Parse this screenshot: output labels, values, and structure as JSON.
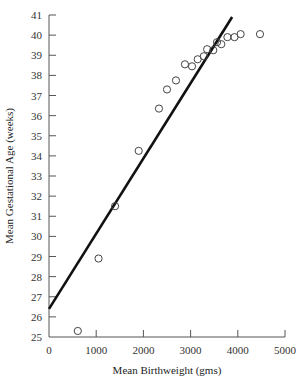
{
  "chart_data": {
    "type": "scatter",
    "title": "",
    "xlabel": "Mean Birthweight (gms)",
    "ylabel": "Mean Gestational Age (weeks)",
    "xlim": [
      0,
      5000
    ],
    "ylim": [
      25,
      41
    ],
    "x_ticks": [
      0,
      1000,
      2000,
      3000,
      4000,
      5000
    ],
    "y_ticks": [
      25,
      26,
      27,
      28,
      29,
      30,
      31,
      32,
      33,
      34,
      35,
      36,
      37,
      38,
      39,
      40,
      41
    ],
    "grid": false,
    "legend": null,
    "series": [
      {
        "name": "observations",
        "marker": "open-circle",
        "points": [
          {
            "x": 610,
            "y": 25.3
          },
          {
            "x": 1050,
            "y": 28.9
          },
          {
            "x": 1400,
            "y": 31.5
          },
          {
            "x": 1900,
            "y": 34.25
          },
          {
            "x": 2330,
            "y": 36.35
          },
          {
            "x": 2500,
            "y": 37.3
          },
          {
            "x": 2690,
            "y": 37.75
          },
          {
            "x": 2880,
            "y": 38.55
          },
          {
            "x": 3030,
            "y": 38.45
          },
          {
            "x": 3150,
            "y": 38.8
          },
          {
            "x": 3280,
            "y": 38.95
          },
          {
            "x": 3350,
            "y": 39.3
          },
          {
            "x": 3480,
            "y": 39.25
          },
          {
            "x": 3560,
            "y": 39.65
          },
          {
            "x": 3650,
            "y": 39.55
          },
          {
            "x": 3780,
            "y": 39.9
          },
          {
            "x": 3930,
            "y": 39.9
          },
          {
            "x": 4060,
            "y": 40.05
          },
          {
            "x": 4470,
            "y": 40.05
          }
        ]
      },
      {
        "name": "regression line",
        "type": "line",
        "points": [
          {
            "x": 0,
            "y": 26.4
          },
          {
            "x": 3880,
            "y": 40.9
          }
        ]
      }
    ]
  }
}
